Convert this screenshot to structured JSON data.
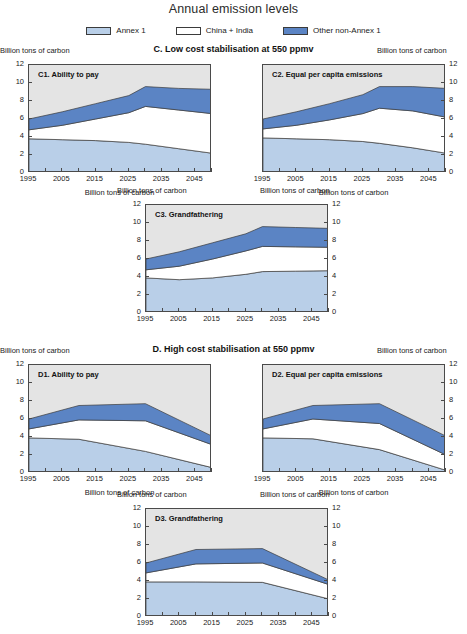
{
  "title": "Annual emission levels",
  "legend": [
    {
      "label": "Annex 1",
      "color": "#b9cfe8",
      "name": "annex-1"
    },
    {
      "label": "China + India",
      "color": "#ffffff",
      "name": "china-india"
    },
    {
      "label": "Other non-Annex 1",
      "color": "#5b84c4",
      "name": "other-non-annex-1"
    }
  ],
  "axis_caption": "Billion tons of carbon",
  "sections": [
    {
      "id": "C",
      "label": "C.  Low cost stabilisation at 550 ppmv"
    },
    {
      "id": "D",
      "label": "D.  High cost stabilisation at 550 ppmv"
    }
  ],
  "panels": [
    {
      "key": "C1",
      "label": "C1.  Ability to pay"
    },
    {
      "key": "C2",
      "label": "C2.  Equal per capita emissions"
    },
    {
      "key": "C3",
      "label": "C3.  Grandfathering"
    },
    {
      "key": "D1",
      "label": "D1.  Ability to pay"
    },
    {
      "key": "D2",
      "label": "D2.  Equal per capita emissions"
    },
    {
      "key": "D3",
      "label": "D3.  Grandfathering"
    }
  ],
  "yticks": [
    "12",
    "10",
    "8",
    "6",
    "4",
    "2",
    "0"
  ],
  "xticks": [
    "1995",
    "2005",
    "2015",
    "2025",
    "2035",
    "2045"
  ],
  "chart_data": {
    "type": "area",
    "title": "Annual emission levels",
    "subtitle": "Stacked area charts of annual carbon emissions by region group under low- and high-cost stabilisation at 550 ppmv",
    "xlabel": "Billion tons of carbon",
    "ylabel": "Billion tons of carbon",
    "xlim": [
      1995,
      2050
    ],
    "ylim": [
      0,
      12
    ],
    "ytick_values": [
      0,
      2,
      4,
      6,
      8,
      10,
      12
    ],
    "xtick_values": [
      1995,
      2005,
      2015,
      2025,
      2035,
      2045
    ],
    "xtick_minor_step": 5,
    "grid": false,
    "legend_position": "top-center",
    "stacking_order": [
      "Annex 1",
      "China + India",
      "Other non-Annex 1"
    ],
    "series_colors": {
      "Annex 1": "#b9cfe8",
      "China + India": "#ffffff",
      "Other non-Annex 1": "#5b84c4"
    },
    "plot_background": "#e4e4e4",
    "panels": [
      {
        "key": "C1",
        "title": "C1.  Ability to pay",
        "section": "C.  Low cost stabilisation at 550 ppmv",
        "x": [
          1995,
          2005,
          2015,
          2025,
          2030,
          2040,
          2050
        ],
        "series": [
          {
            "name": "Annex 1",
            "values": [
              3.8,
              3.7,
              3.6,
              3.4,
              3.2,
              2.7,
              2.2
            ]
          },
          {
            "name": "China + India",
            "values": [
              1.0,
              1.6,
              2.4,
              3.3,
              4.2,
              4.3,
              4.4
            ]
          },
          {
            "name": "Other non-Annex 1",
            "values": [
              1.2,
              1.5,
              1.7,
              1.9,
              2.2,
              2.4,
              2.7
            ]
          }
        ],
        "cumulative_top": [
          6.0,
          6.8,
          7.7,
          8.6,
          9.6,
          9.4,
          9.3
        ]
      },
      {
        "key": "C2",
        "title": "C2.  Equal per capita emissions",
        "section": "C.  Low cost stabilisation at 550 ppmv",
        "x": [
          1995,
          2005,
          2015,
          2025,
          2030,
          2040,
          2050
        ],
        "series": [
          {
            "name": "Annex 1",
            "values": [
              3.9,
              3.8,
              3.7,
              3.5,
              3.3,
              2.8,
              2.2
            ]
          },
          {
            "name": "China + India",
            "values": [
              1.0,
              1.5,
              2.2,
              3.1,
              3.9,
              4.1,
              4.0
            ]
          },
          {
            "name": "Other non-Annex 1",
            "values": [
              1.1,
              1.5,
              1.8,
              2.1,
              2.4,
              2.7,
              3.2
            ]
          }
        ],
        "cumulative_top": [
          6.0,
          6.8,
          7.7,
          8.7,
          9.6,
          9.6,
          9.4
        ]
      },
      {
        "key": "C3",
        "title": "C3.  Grandfathering",
        "section": "C.  Low cost stabilisation at 550 ppmv",
        "x": [
          1995,
          2005,
          2015,
          2025,
          2030,
          2040,
          2050
        ],
        "series": [
          {
            "name": "Annex 1",
            "values": [
              3.9,
              3.7,
              3.9,
              4.3,
              4.6,
              4.65,
              4.7
            ]
          },
          {
            "name": "China + India",
            "values": [
              0.9,
              1.5,
              2.1,
              2.6,
              2.8,
              2.7,
              2.6
            ]
          },
          {
            "name": "Other non-Annex 1",
            "values": [
              1.2,
              1.6,
              1.8,
              1.9,
              2.2,
              2.15,
              2.1
            ]
          }
        ],
        "cumulative_top": [
          6.0,
          6.8,
          7.8,
          8.8,
          9.6,
          9.5,
          9.4
        ]
      },
      {
        "key": "D1",
        "title": "D1.  Ability to pay",
        "section": "D.  High cost stabilisation at 550 ppmv",
        "x": [
          1995,
          2010,
          2030,
          2050
        ],
        "series": [
          {
            "name": "Annex 1",
            "values": [
              3.9,
              3.75,
              2.4,
              0.6
            ]
          },
          {
            "name": "China + India",
            "values": [
              1.0,
              2.15,
              3.4,
              2.55
            ]
          },
          {
            "name": "Other non-Annex 1",
            "values": [
              1.1,
              1.6,
              1.9,
              0.95
            ]
          }
        ],
        "cumulative_top": [
          6.0,
          7.5,
          7.7,
          4.1
        ]
      },
      {
        "key": "D2",
        "title": "D2.  Equal per capita emissions",
        "section": "D.  High cost stabilisation at 550 ppmv",
        "x": [
          1995,
          2010,
          2030,
          2050
        ],
        "series": [
          {
            "name": "Annex 1",
            "values": [
              3.9,
              3.8,
              2.6,
              0.3
            ]
          },
          {
            "name": "China + India",
            "values": [
              1.0,
              2.2,
              2.9,
              1.7
            ]
          },
          {
            "name": "Other non-Annex 1",
            "values": [
              1.1,
              1.5,
              2.2,
              2.1
            ]
          }
        ],
        "cumulative_top": [
          6.0,
          7.5,
          7.7,
          4.1
        ]
      },
      {
        "key": "D3",
        "title": "D3.  Grandfathering",
        "section": "D.  High cost stabilisation at 550 ppmv",
        "x": [
          1995,
          2010,
          2030,
          2050
        ],
        "series": [
          {
            "name": "Annex 1",
            "values": [
              3.9,
              3.9,
              3.85,
              2.0
            ]
          },
          {
            "name": "China + India",
            "values": [
              1.0,
              2.0,
              2.15,
              1.6
            ]
          },
          {
            "name": "Other non-Annex 1",
            "values": [
              1.1,
              1.6,
              1.6,
              0.5
            ]
          }
        ],
        "cumulative_top": [
          6.0,
          7.5,
          7.6,
          4.1
        ]
      }
    ]
  }
}
